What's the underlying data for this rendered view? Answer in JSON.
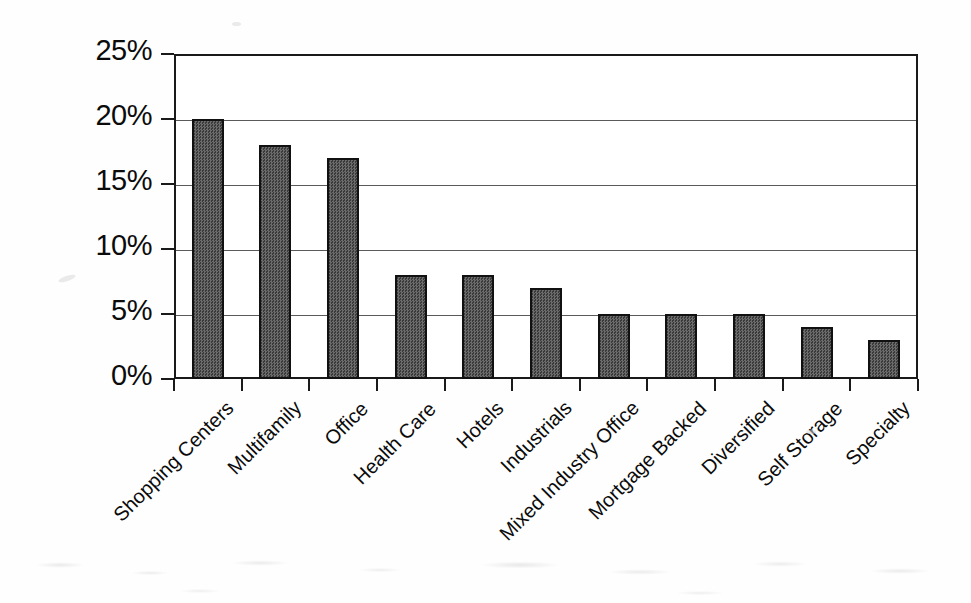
{
  "chart_data": {
    "type": "bar",
    "title": "",
    "subtitle": "",
    "xlabel": "",
    "ylabel": "",
    "categories": [
      "Shopping Centers",
      "Multifamily",
      "Office",
      "Health Care",
      "Hotels",
      "Industrials",
      "Mixed Industry Office",
      "Mortgage Backed",
      "Diversified",
      "Self Storage",
      "Specialty"
    ],
    "values": [
      20,
      18,
      17,
      8,
      8,
      7,
      5,
      5,
      5,
      4,
      3
    ],
    "value_unit": "%",
    "ylim": [
      0,
      25
    ],
    "ytick_values": [
      0,
      5,
      10,
      15,
      20,
      25
    ],
    "ytick_labels": [
      "0%",
      "5%",
      "10%",
      "15%",
      "20%",
      "25%"
    ],
    "grid": true,
    "grid_axis": "y",
    "legend": false,
    "legend_position": "none",
    "bar_fill_color": "#585858",
    "bar_edge_color": "#111111",
    "axis_color": "#1a1a1a",
    "gridline_color": "#5a5a5a",
    "background_color": "#ffffff",
    "xtick_label_rotation": -45
  }
}
